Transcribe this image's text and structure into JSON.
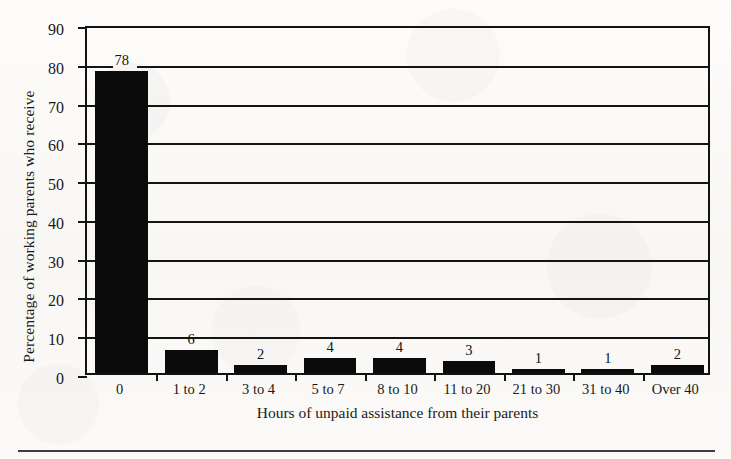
{
  "chart_data": {
    "type": "bar",
    "title": "",
    "xlabel": "Hours of unpaid assistance from their parents",
    "ylabel": "Percentage of working parents who receive",
    "categories": [
      "0",
      "1 to 2",
      "3 to 4",
      "5 to 7",
      "8 to 10",
      "11 to 20",
      "21 to 30",
      "31 to 40",
      "Over 40"
    ],
    "values": [
      78,
      6,
      2,
      4,
      4,
      3,
      1,
      1,
      2
    ],
    "value_labels": [
      "78",
      "6",
      "2",
      "4",
      "4",
      "3",
      "1",
      "1",
      "2"
    ],
    "ylim": [
      0,
      90
    ],
    "ytick_values": [
      0,
      10,
      20,
      30,
      40,
      50,
      60,
      70,
      80,
      90
    ],
    "ytick_labels": [
      "0",
      "10",
      "20",
      "30",
      "40",
      "50",
      "60",
      "70",
      "80",
      "90"
    ],
    "grid": true,
    "grid_axis": "y",
    "legend": "none",
    "bar_color": "#0b0b0b",
    "axis_color": "#141414",
    "background_color": "#fbfaf8"
  },
  "figure": {
    "bottom_rule_color": "#3c3c46"
  }
}
